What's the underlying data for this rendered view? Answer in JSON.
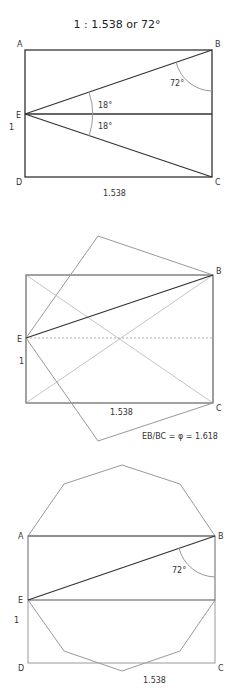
{
  "title": "1 : 1.538 or 72°",
  "figure1": {
    "labels": {
      "A": "A",
      "B": "B",
      "C": "C",
      "D": "D",
      "E": "E"
    },
    "side_label": "1",
    "base_label": "1.538",
    "angle_b": "72°",
    "angle_upper": "18°",
    "angle_lower": "18°"
  },
  "figure2": {
    "labels": {
      "B": "B",
      "C": "C",
      "E": "E"
    },
    "side_label": "1",
    "base_label": "1.538",
    "ratio_text": "EB/BC = φ  = 1.618"
  },
  "figure3": {
    "labels": {
      "A": "A",
      "B": "B",
      "C": "C",
      "D": "D",
      "E": "E"
    },
    "side_label": "1",
    "base_label": "1.538",
    "angle_b": "72°"
  }
}
